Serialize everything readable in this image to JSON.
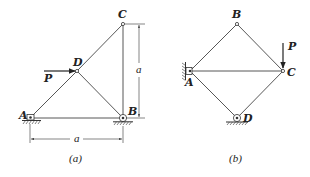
{
  "figures": [
    {
      "id": "a",
      "caption": "(a)",
      "nodes": {
        "A": {
          "label": "A",
          "support": "pin"
        },
        "B": {
          "label": "B",
          "support": "roller"
        },
        "C": {
          "label": "C"
        },
        "D": {
          "label": "D"
        }
      },
      "members": [
        "A-B",
        "B-C",
        "A-D",
        "D-C",
        "D-B"
      ],
      "load": {
        "label": "P",
        "at": "D",
        "direction": "horizontal-right"
      },
      "dimensions": [
        {
          "label": "a",
          "orientation": "vertical",
          "from": "B",
          "to": "C"
        },
        {
          "label": "a",
          "orientation": "horizontal",
          "from": "A",
          "to": "B"
        }
      ]
    },
    {
      "id": "b",
      "caption": "(b)",
      "nodes": {
        "A": {
          "label": "A",
          "support": "pin-wall"
        },
        "B": {
          "label": "B"
        },
        "C": {
          "label": "C"
        },
        "D": {
          "label": "D",
          "support": "roller"
        }
      },
      "members": [
        "A-B",
        "B-C",
        "A-C",
        "A-D",
        "D-C"
      ],
      "load": {
        "label": "P",
        "at": "C",
        "direction": "vertical-down"
      }
    }
  ]
}
